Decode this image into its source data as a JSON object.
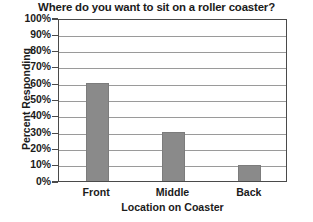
{
  "chart_data": {
    "type": "bar",
    "title": "Where do you want to sit on a roller coaster?",
    "xlabel": "Location on Coaster",
    "ylabel": "Percent Responding",
    "categories": [
      "Front",
      "Middle",
      "Back"
    ],
    "values": [
      60,
      30,
      10
    ],
    "ylim": [
      0,
      100
    ],
    "ytick_labels": [
      "100%",
      "90%",
      "80%",
      "70%",
      "60%",
      "50%",
      "40%",
      "30%",
      "20%",
      "10%",
      "0%"
    ],
    "ytick_values": [
      100,
      90,
      80,
      70,
      60,
      50,
      40,
      30,
      20,
      10,
      0
    ],
    "grid": true,
    "legend": false,
    "bar_color": "#8a8a8a",
    "axis_color": "#4a4a4a",
    "grid_color": "#9a9a9a",
    "background": "#ffffff"
  }
}
